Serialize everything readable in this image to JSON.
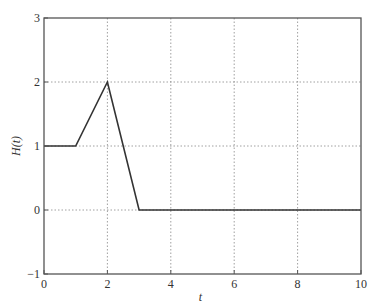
{
  "chart_data": {
    "type": "line",
    "title": "",
    "xlabel": "t",
    "ylabel": "H(t)",
    "xlim": [
      0,
      10
    ],
    "ylim": [
      -1,
      3
    ],
    "grid": true,
    "legend": null,
    "x_ticks": [
      0,
      2,
      4,
      6,
      8,
      10
    ],
    "y_ticks": [
      -1,
      0,
      1,
      2,
      3
    ],
    "x_tick_labels": [
      "0",
      "2",
      "4",
      "6",
      "8",
      "10"
    ],
    "y_tick_labels": [
      "−1",
      "0",
      "1",
      "2",
      "3"
    ],
    "series": [
      {
        "name": "H(t)",
        "x": [
          0,
          1,
          2,
          3,
          10
        ],
        "y": [
          1,
          1,
          2,
          0,
          0
        ],
        "color": "#333333"
      }
    ]
  },
  "colors": {
    "line": "#333333",
    "axes": "#555555",
    "grid": "#888888"
  }
}
